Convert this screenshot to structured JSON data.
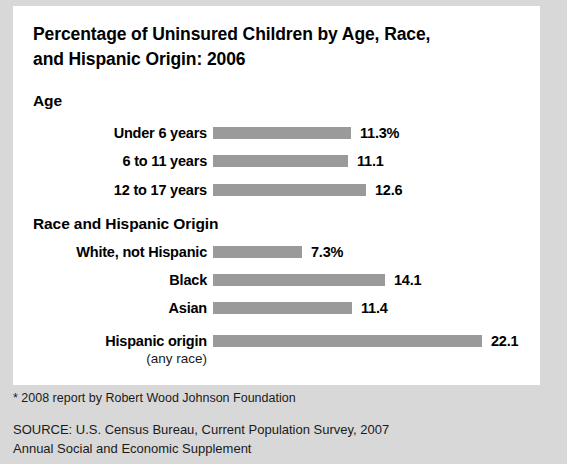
{
  "figure": {
    "title_line1": "Percentage of Uninsured Children by Age, Race,",
    "title_line2": "and Hispanic Origin: 2006",
    "footnote": "* 2008 report by Robert Wood Johnson Foundation",
    "source_line1": "SOURCE: U.S. Census Bureau, Current Population Survey, 2007",
    "source_line2": "Annual Social and Economic Supplement",
    "panel_color": "#ffffff",
    "page_color": "#d8d8d8",
    "bar_color": "#9a9a9a",
    "text_color": "#000000"
  },
  "sections": [
    {
      "heading": "Age"
    },
    {
      "heading": "Race and Hispanic Origin"
    }
  ],
  "bars": [
    {
      "label": "Under 6 years",
      "sublabel": "",
      "value": 11.3,
      "value_text": "11.3%"
    },
    {
      "label": "6 to 11 years",
      "sublabel": "",
      "value": 11.1,
      "value_text": "11.1"
    },
    {
      "label": "12 to 17 years",
      "sublabel": "",
      "value": 12.6,
      "value_text": "12.6"
    },
    {
      "label": "White, not Hispanic",
      "sublabel": "",
      "value": 7.3,
      "value_text": "7.3%"
    },
    {
      "label": "Black",
      "sublabel": "",
      "value": 14.1,
      "value_text": "14.1"
    },
    {
      "label": "Asian",
      "sublabel": "",
      "value": 11.4,
      "value_text": "11.4"
    },
    {
      "label": "Hispanic origin",
      "sublabel": "(any race)",
      "value": 22.1,
      "value_text": "22.1"
    }
  ],
  "chart_data": {
    "type": "bar",
    "orientation": "horizontal",
    "title": "Percentage of Uninsured Children by Age, Race, and Hispanic Origin: 2006",
    "xlabel": "",
    "ylabel": "",
    "units": "percent",
    "grid": false,
    "legend": "none",
    "xlim": [
      0,
      22.1
    ],
    "groups": [
      {
        "name": "Age",
        "categories": [
          "Under 6 years",
          "6 to 11 years",
          "12 to 17 years"
        ],
        "values": [
          11.3,
          11.1,
          12.6
        ]
      },
      {
        "name": "Race and Hispanic Origin",
        "categories": [
          "White, not Hispanic",
          "Black",
          "Asian",
          "Hispanic origin (any race)"
        ],
        "values": [
          7.3,
          14.1,
          11.4,
          22.1
        ]
      }
    ],
    "categories": [
      "Under 6 years",
      "6 to 11 years",
      "12 to 17 years",
      "White, not Hispanic",
      "Black",
      "Asian",
      "Hispanic origin (any race)"
    ],
    "values": [
      11.3,
      11.1,
      12.6,
      7.3,
      14.1,
      11.4,
      22.1
    ],
    "data_labels": [
      "11.3%",
      "11.1",
      "12.6",
      "7.3%",
      "14.1",
      "11.4",
      "22.1"
    ],
    "annotations": [
      "* 2008 report by Robert Wood Johnson Foundation",
      "SOURCE: U.S. Census Bureau, Current Population Survey, 2007 Annual Social and Economic Supplement"
    ]
  },
  "layout": {
    "bar_tops": [
      116,
      144,
      173,
      235,
      263,
      291,
      324
    ],
    "px_per_unit": 12.17
  }
}
